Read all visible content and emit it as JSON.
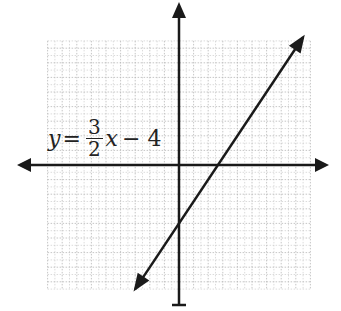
{
  "chart_data": {
    "type": "line",
    "title": "",
    "equation": {
      "lhs": "y",
      "equals": "=",
      "numerator": "3",
      "denominator": "2",
      "var": "x",
      "rest": "− 4"
    },
    "slope": 1.5,
    "intercept": -4,
    "x_intercept": 2.667,
    "segment": {
      "x_start": -3,
      "y_start": -8.5,
      "x_end": 8.5,
      "y_end": 8.75
    },
    "xlim": [
      -9,
      9
    ],
    "ylim": [
      -8.5,
      8.5
    ],
    "grid": true,
    "axes_arrows": true,
    "tick_labels": false,
    "xlabel": "",
    "ylabel": ""
  },
  "colors": {
    "line": "#1a1a1a",
    "grid": "#b8b8b8",
    "axis": "#1a1a1a"
  }
}
